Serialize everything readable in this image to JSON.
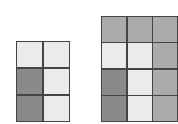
{
  "colors": {
    "L": "#ebebeb",
    "M": "#ababab",
    "D": "#8a8a8a",
    "border": "#444444"
  },
  "grids": [
    {
      "name": "left-grid",
      "cols": 2,
      "rows": 3,
      "cells": [
        "L",
        "L",
        "D",
        "L",
        "D",
        "L"
      ]
    },
    {
      "name": "right-grid",
      "cols": 3,
      "rows": 4,
      "cells": [
        "M",
        "M",
        "M",
        "L",
        "L",
        "M",
        "D",
        "L",
        "M",
        "D",
        "L",
        "M"
      ]
    }
  ]
}
